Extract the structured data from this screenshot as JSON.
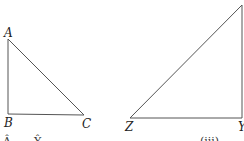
{
  "diagram": {
    "background": "#ffffff",
    "stroke_color": "#555555",
    "label_color": "#222222",
    "triangles": [
      {
        "name": "ABC",
        "vertices": [
          {
            "label": "A",
            "x": 8,
            "y": 39,
            "label_x": 4,
            "label_y": 37
          },
          {
            "label": "B",
            "x": 8,
            "y": 114,
            "label_x": 4,
            "label_y": 127
          },
          {
            "label": "C",
            "x": 84,
            "y": 115,
            "label_x": 82,
            "label_y": 128
          }
        ]
      },
      {
        "name": "XYZ",
        "vertices": [
          {
            "label": "",
            "x": 242,
            "y": 5,
            "label_x": 238,
            "label_y": 4
          },
          {
            "label": "Z",
            "x": 130,
            "y": 118,
            "label_x": 125,
            "label_y": 131
          },
          {
            "label": "Y",
            "x": 242,
            "y": 118,
            "label_x": 238,
            "label_y": 131
          }
        ]
      }
    ],
    "cutoff_text": [
      {
        "text": "Â",
        "x": 3,
        "y": 146
      },
      {
        "text": "Ŷ",
        "x": 34,
        "y": 146
      },
      {
        "text": "(iii)",
        "x": 200,
        "y": 146
      }
    ]
  }
}
